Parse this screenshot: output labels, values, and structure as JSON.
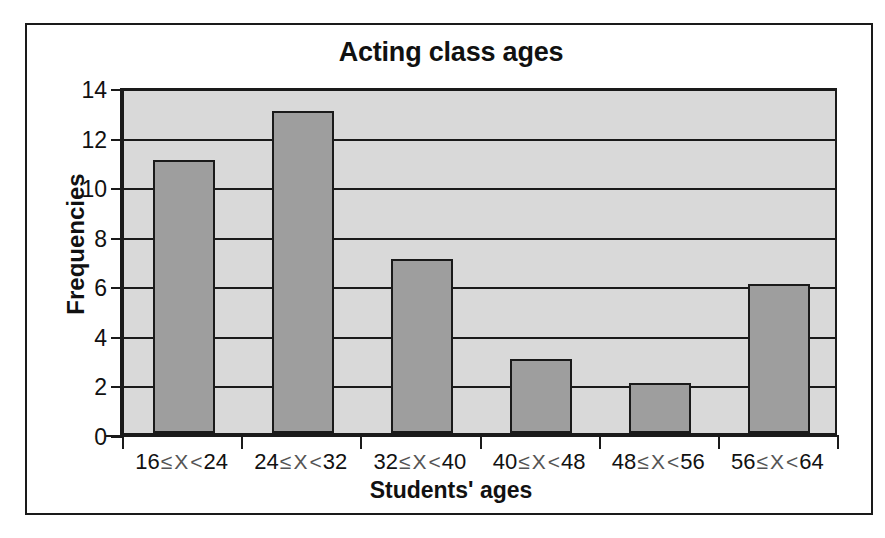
{
  "chart_data": {
    "type": "bar",
    "title": "Acting class ages",
    "xlabel": "Students' ages",
    "ylabel": "Frequencies",
    "categories": [
      "16≤X<24",
      "24≤X<32",
      "32≤X<40",
      "40≤X<48",
      "48≤X<56",
      "56≤X<64"
    ],
    "values": [
      11,
      13,
      7,
      3,
      2,
      6
    ],
    "ylim": [
      0,
      14
    ],
    "yticks": [
      0,
      2,
      4,
      6,
      8,
      10,
      12,
      14
    ],
    "ytick_labels": [
      "0",
      "2",
      "4",
      "6",
      "8",
      "10",
      "12",
      "14"
    ],
    "grid": true,
    "legend": null,
    "bar_color": "#9e9e9e",
    "plot_background": "#d9d9d9",
    "axis_color": "#1a1a1a",
    "category_parts": [
      {
        "low": "16",
        "rel1": "≤",
        "var": "X",
        "rel2": "<",
        "high": "24"
      },
      {
        "low": "24",
        "rel1": "≤",
        "var": "X",
        "rel2": "<",
        "high": "32"
      },
      {
        "low": "32",
        "rel1": "≤",
        "var": "X",
        "rel2": "<",
        "high": "40"
      },
      {
        "low": "40",
        "rel1": "≤",
        "var": "X",
        "rel2": "<",
        "high": "48"
      },
      {
        "low": "48",
        "rel1": "≤",
        "var": "X",
        "rel2": "<",
        "high": "56"
      },
      {
        "low": "56",
        "rel1": "≤",
        "var": "X",
        "rel2": "<",
        "high": "64"
      }
    ]
  }
}
